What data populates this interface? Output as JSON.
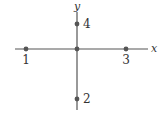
{
  "diagram": {
    "type": "coordinate-axes-with-labeled-points",
    "axes": {
      "x_label": "x",
      "y_label": "y",
      "origin": [
        77,
        49
      ],
      "x_axis": {
        "x1": 15,
        "x2": 148,
        "y": 49
      },
      "y_axis": {
        "y1": 12,
        "y2": 110,
        "x": 77
      }
    },
    "points": [
      {
        "label": "1",
        "position": "negative-x",
        "cx": 26,
        "cy": 49,
        "lx": 26,
        "ly": 64,
        "anchor": "middle"
      },
      {
        "label": "2",
        "position": "negative-y",
        "cx": 77,
        "cy": 99,
        "lx": 83,
        "ly": 103,
        "anchor": "start"
      },
      {
        "label": "3",
        "position": "positive-x",
        "cx": 126,
        "cy": 49,
        "lx": 126,
        "ly": 64,
        "anchor": "middle"
      },
      {
        "label": "4",
        "position": "positive-y",
        "cx": 77,
        "cy": 24,
        "lx": 83,
        "ly": 28,
        "anchor": "start"
      }
    ],
    "origin_dot": {
      "cx": 77,
      "cy": 49
    },
    "colors": {
      "axis": "#555555",
      "point": "#555555",
      "text": "#333333"
    }
  }
}
